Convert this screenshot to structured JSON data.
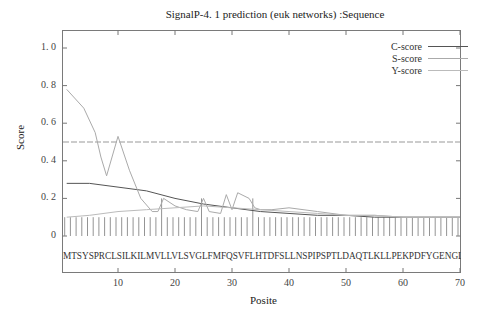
{
  "chart_data": {
    "type": "line",
    "title": "SignalP-4. 1 prediction (euk networks) :Sequence",
    "xlabel": "Posite",
    "ylabel": "Score",
    "xlim": [
      0,
      70
    ],
    "ylim": [
      -0.2,
      1.1
    ],
    "x_ticks": [
      "10",
      "20",
      "30",
      "40",
      "50",
      "60",
      "70"
    ],
    "y_ticks": [
      "0",
      "0. 2",
      "0. 4",
      "0. 6",
      "0. 8",
      "1. 0"
    ],
    "legend": [
      "C-score",
      "S-score",
      "Y-score"
    ],
    "legend_position": "upper right",
    "grid": false,
    "threshold": 0.5,
    "sequence": "MTSYSPRCLSILKILMVLLVLSVGLFMFQSVFLHTDFSLLNSPIPSPTLDAQTLKLLPEKPDFYGENGLF",
    "series": [
      {
        "name": "C-score",
        "x": [
          1,
          5,
          10,
          15,
          20,
          25,
          30,
          35,
          40,
          45,
          50,
          55,
          60,
          65,
          70
        ],
        "values": [
          0.28,
          0.28,
          0.26,
          0.24,
          0.2,
          0.17,
          0.15,
          0.13,
          0.12,
          0.11,
          0.11,
          0.1,
          0.1,
          0.1,
          0.1
        ]
      },
      {
        "name": "S-score",
        "x": [
          1,
          4,
          6,
          7,
          8,
          10,
          12,
          14,
          16,
          17,
          18,
          20,
          22,
          24,
          25,
          26,
          28,
          29,
          30,
          31,
          33,
          34,
          35,
          37,
          40,
          45,
          50,
          55,
          60,
          65,
          70
        ],
        "values": [
          0.78,
          0.68,
          0.55,
          0.42,
          0.32,
          0.53,
          0.35,
          0.2,
          0.13,
          0.13,
          0.2,
          0.16,
          0.14,
          0.13,
          0.2,
          0.13,
          0.12,
          0.22,
          0.14,
          0.23,
          0.2,
          0.15,
          0.14,
          0.14,
          0.15,
          0.13,
          0.11,
          0.11,
          0.1,
          0.1,
          0.1
        ]
      },
      {
        "name": "Y-score",
        "x": [
          1,
          5,
          10,
          15,
          20,
          25,
          30,
          35,
          40,
          45,
          50,
          55,
          60,
          65,
          70
        ],
        "values": [
          0.1,
          0.11,
          0.13,
          0.14,
          0.15,
          0.16,
          0.15,
          0.14,
          0.13,
          0.12,
          0.11,
          0.11,
          0.1,
          0.1,
          0.1
        ]
      }
    ],
    "residue_bars": {
      "count": 70,
      "height": 0.1,
      "tall_positions": [
        18,
        25,
        34
      ],
      "tall_height": 0.2
    }
  }
}
